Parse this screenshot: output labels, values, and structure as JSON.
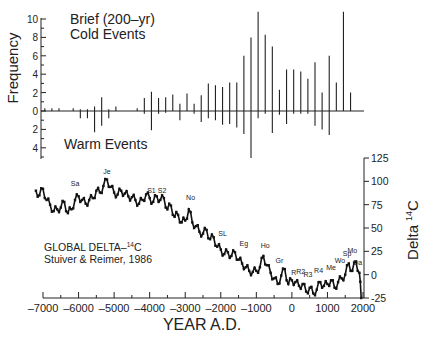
{
  "chart_data": [
    {
      "type": "bar",
      "title": "Brief (200-yr) Cold Events",
      "annotation_bottom": "Warm Events",
      "ylabel": "Frequency",
      "xlabel": "YEAR A.D.",
      "xlim": [
        -7000,
        2000
      ],
      "ylim_cold": [
        0,
        10
      ],
      "ylim_warm": [
        0,
        4
      ],
      "yticks_cold": [
        "10",
        "8",
        "6",
        "4",
        "2",
        "0"
      ],
      "yticks_warm": [
        "2",
        "4"
      ],
      "x": [
        -6950,
        -6750,
        -6550,
        -6150,
        -5950,
        -5750,
        -5550,
        -5350,
        -5150,
        -4950,
        -4350,
        -4150,
        -3950,
        -3750,
        -3550,
        -3350,
        -3150,
        -2950,
        -2750,
        -2550,
        -2350,
        -2150,
        -1950,
        -1750,
        -1550,
        -1350,
        -1150,
        -950,
        -750,
        -550,
        -350,
        -150,
        50,
        250,
        450,
        650,
        850,
        1050,
        1250,
        1450,
        1650,
        1850
      ],
      "cold": [
        0.3,
        0.3,
        0.3,
        0.3,
        0.2,
        0.2,
        0.5,
        1.5,
        0.2,
        0.5,
        0.3,
        1.4,
        2.1,
        1.4,
        1.5,
        1.8,
        0.8,
        1.9,
        0.8,
        1.7,
        3.0,
        2.8,
        2.6,
        3.1,
        3.1,
        6.0,
        8.0,
        10.8,
        8.3,
        7.0,
        2.3,
        4.5,
        4.5,
        4.3,
        3.5,
        5.3,
        2.0,
        6.0,
        3.1,
        10.8,
        2.0,
        0.0
      ],
      "warm": [
        0.0,
        0.0,
        0.0,
        0.0,
        0.8,
        0.8,
        2.3,
        1.6,
        0.8,
        0.0,
        0.0,
        0.3,
        2.1,
        0.3,
        0.2,
        0.0,
        1.0,
        0.0,
        0.3,
        1.2,
        0.8,
        1.0,
        1.5,
        1.4,
        1.8,
        2.5,
        5.1,
        0.8,
        0.3,
        2.4,
        0.4,
        1.4,
        0.3,
        0.3,
        0.3,
        1.6,
        2.0,
        2.6,
        0.0,
        0.0,
        0.0,
        0.0
      ]
    },
    {
      "type": "line",
      "title": "GLOBAL DELTA-14C",
      "subtitle": "Stuiver & Reimer, 1986",
      "ylabel": "Delta 14C",
      "xlabel": "YEAR A.D.",
      "xlim": [
        -7000,
        2000
      ],
      "ylim": [
        -25,
        125
      ],
      "xticks": [
        "-7000",
        "-6000",
        "-5000",
        "-4000",
        "-3000",
        "-2000",
        "-1000",
        "0",
        "1000",
        "2000"
      ],
      "yticks": [
        "125",
        "100",
        "75",
        "50",
        "25",
        "0",
        "-25"
      ],
      "grid": false,
      "x": [
        -7200,
        -7100,
        -7000,
        -6900,
        -6800,
        -6700,
        -6600,
        -6500,
        -6400,
        -6300,
        -6200,
        -6100,
        -6000,
        -5900,
        -5800,
        -5700,
        -5600,
        -5500,
        -5400,
        -5300,
        -5200,
        -5100,
        -5000,
        -4900,
        -4800,
        -4700,
        -4600,
        -4500,
        -4400,
        -4300,
        -4200,
        -4100,
        -4000,
        -3900,
        -3800,
        -3700,
        -3600,
        -3500,
        -3400,
        -3300,
        -3200,
        -3100,
        -3000,
        -2900,
        -2800,
        -2700,
        -2600,
        -2500,
        -2400,
        -2300,
        -2200,
        -2100,
        -2000,
        -1900,
        -1800,
        -1700,
        -1600,
        -1500,
        -1400,
        -1300,
        -1200,
        -1100,
        -1000,
        -900,
        -800,
        -700,
        -600,
        -500,
        -400,
        -300,
        -200,
        -100,
        0,
        100,
        200,
        300,
        400,
        500,
        600,
        700,
        800,
        900,
        1000,
        1100,
        1200,
        1300,
        1400,
        1500,
        1600,
        1700,
        1800,
        1900,
        1950
      ],
      "values": [
        90,
        85,
        92,
        80,
        75,
        68,
        70,
        72,
        78,
        66,
        70,
        80,
        84,
        80,
        76,
        80,
        82,
        90,
        88,
        95,
        102,
        94,
        88,
        86,
        90,
        87,
        84,
        83,
        80,
        76,
        80,
        86,
        82,
        78,
        84,
        80,
        82,
        70,
        74,
        62,
        64,
        56,
        58,
        70,
        56,
        52,
        46,
        44,
        48,
        38,
        40,
        30,
        27,
        22,
        24,
        20,
        24,
        16,
        12,
        8,
        4,
        3,
        4,
        8,
        20,
        10,
        2,
        -4,
        -10,
        -1,
        6,
        -10,
        -6,
        -8,
        -12,
        -10,
        -18,
        -14,
        -20,
        -16,
        -8,
        -12,
        -10,
        -6,
        -14,
        -8,
        -4,
        0,
        12,
        4,
        14,
        2,
        -25
      ],
      "event_labels": [
        {
          "label": "Sa",
          "x": -6100,
          "y": 95
        },
        {
          "label": "Je",
          "x": -5200,
          "y": 108
        },
        {
          "label": "S1",
          "x": -3950,
          "y": 88
        },
        {
          "label": "S2",
          "x": -3650,
          "y": 88
        },
        {
          "label": "No",
          "x": -2850,
          "y": 80
        },
        {
          "label": "SL",
          "x": -1950,
          "y": 41
        },
        {
          "label": "Eg",
          "x": -1350,
          "y": 31
        },
        {
          "label": "Ho",
          "x": -750,
          "y": 29
        },
        {
          "label": "Gr",
          "x": -350,
          "y": 12
        },
        {
          "label": "R",
          "x": 50,
          "y": 0
        },
        {
          "label": "R2",
          "x": 250,
          "y": 1
        },
        {
          "label": "R3",
          "x": 450,
          "y": -3
        },
        {
          "label": "R4",
          "x": 750,
          "y": 2
        },
        {
          "label": "Me",
          "x": 1100,
          "y": 5
        },
        {
          "label": "Wo",
          "x": 1350,
          "y": 12
        },
        {
          "label": "Sp",
          "x": 1550,
          "y": 20
        },
        {
          "label": "Mo",
          "x": 1700,
          "y": 23
        },
        {
          "label": "Da",
          "x": 1850,
          "y": 10
        }
      ]
    }
  ],
  "labels": {
    "cold_title_1": "Brief (200–yr)",
    "cold_title_2": "Cold Events",
    "warm_title": "Warm Events",
    "freq_axis": "Frequency",
    "delta_axis": "Delta",
    "delta_axis_sup": "14",
    "delta_axis_c": "C",
    "legend_1": "GLOBAL DELTA–",
    "legend_1_sup": "14",
    "legend_1_c": "C",
    "legend_2": "Stuiver & Reimer, 1986",
    "x_axis": "YEAR A.D."
  }
}
